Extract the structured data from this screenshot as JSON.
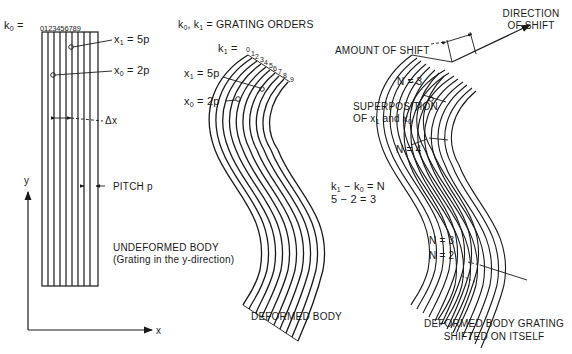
{
  "figure": {
    "panels": [
      {
        "id": "undeformed",
        "k0_prefix": "k",
        "k0_sub": "0",
        "k0_eq": " = ",
        "order_numbers": "0123456789",
        "x1_label": "x",
        "x1_sub": "1",
        "x1_value": " = 5p",
        "x0_label": "x",
        "x0_sub": "0",
        "x0_value": " = 2p",
        "delta_x": "Δx",
        "pitch": "PITCH  p",
        "y_axis": "y",
        "x_axis": "x",
        "caption_line1": "UNDEFORMED  BODY",
        "caption_line2": "(Grating in the y-direction)"
      },
      {
        "id": "deformed",
        "orders_title": "k, k = GRATING  ORDERS",
        "orders_k0": "k",
        "orders_k0_sub": "0",
        "orders_sep": ", ",
        "orders_k1": "k",
        "orders_k1_sub": "1",
        "orders_rest": " = GRATING  ORDERS",
        "k1_prefix": "k",
        "k1_sub": "1",
        "k1_eq": " = ",
        "order_numbers": [
          "0",
          "1",
          "2",
          "3",
          "4",
          "5",
          "6",
          "7",
          "8",
          "9"
        ],
        "x1_label": "x",
        "x1_sub": "1",
        "x1_value": " = 5p",
        "x0_label": "x",
        "x0_sub": "0",
        "x0_value": " = 2p",
        "eq1_a": "k",
        "eq1_a_sub": "1",
        "eq1_mid": " − k",
        "eq1_b_sub": "0",
        "eq1_end": " = N",
        "eq2": "5 − 2 = 3",
        "caption": "DEFORMED  BODY"
      },
      {
        "id": "shifted",
        "direction_line1": "DIRECTION",
        "direction_line2": "OF  SHIFT",
        "amount": "AMOUNT  OF  SHIFT",
        "superposition_line1": "SUPERPOSITION",
        "superposition_line2_a": "OF  x",
        "superposition_line2_sub1": "1",
        "superposition_line2_b": " and  x",
        "superposition_line2_sub0": "0",
        "n_labels": [
          "N = 3",
          "N = 4",
          "N = 3",
          "N = 2"
        ],
        "caption_line1": "DEFORMED  BODY  GRATING",
        "caption_line2": "SHIFTED  ON  ITSELF"
      }
    ]
  },
  "colors": {
    "ink": "#1a1a1a",
    "background": "#ffffff"
  }
}
